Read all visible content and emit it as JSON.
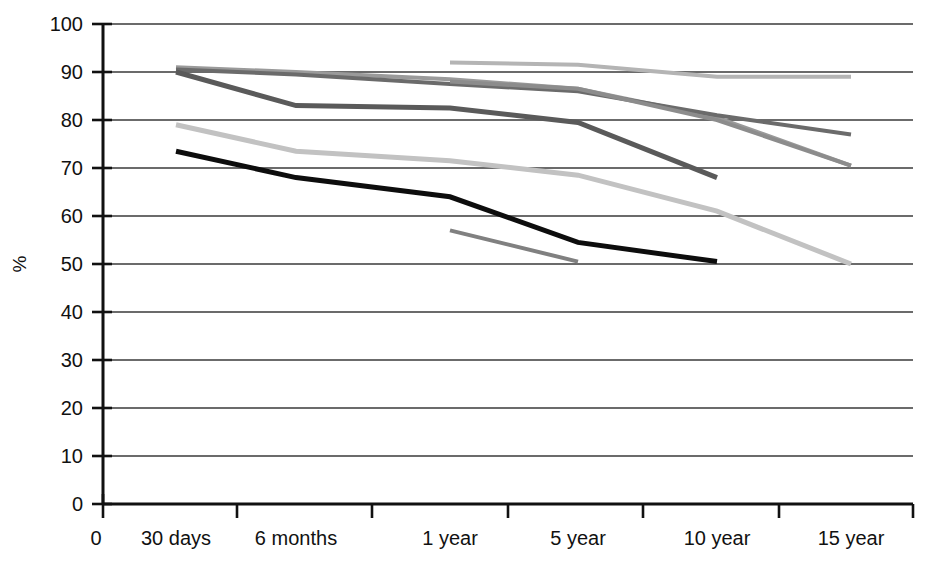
{
  "chart_data": {
    "type": "line",
    "title": "",
    "xlabel": "",
    "ylabel": "%",
    "ylim": [
      0,
      100
    ],
    "ytick_values": [
      0,
      10,
      20,
      30,
      40,
      50,
      60,
      70,
      80,
      90,
      100
    ],
    "ytick_labels": [
      "0",
      "10",
      "20",
      "30",
      "40",
      "50",
      "60",
      "70",
      "80",
      "90",
      "100"
    ],
    "categories": [
      "0",
      "30 days",
      "6 months",
      "1 year",
      "5 year",
      "10 year",
      "15 year"
    ],
    "grid": "horizontal",
    "legend": "none",
    "series": [
      {
        "name": "series-1",
        "color": "#9a9a9a",
        "width": 4,
        "x": [
          "30 days",
          "6 months",
          "1 year",
          "5 year",
          "10 year",
          "15 year"
        ],
        "values": [
          91,
          90,
          88.5,
          86.5,
          80.5,
          70.5
        ]
      },
      {
        "name": "series-2",
        "color": "#6b6b6b",
        "width": 4,
        "x": [
          "30 days",
          "6 months",
          "1 year",
          "5 year",
          "10 year",
          "15 year"
        ],
        "values": [
          90.5,
          89.5,
          87.5,
          86,
          81,
          77
        ]
      },
      {
        "name": "series-3",
        "color": "#5a5a5a",
        "width": 5,
        "x": [
          "30 days",
          "6 months",
          "1 year",
          "5 year",
          "10 year"
        ],
        "values": [
          90,
          83,
          82.5,
          79.5,
          68
        ]
      },
      {
        "name": "series-4",
        "color": "#b4b4b4",
        "width": 4,
        "x": [
          "1 year",
          "5 year",
          "10 year",
          "15 year"
        ],
        "values": [
          92,
          91.5,
          89,
          89
        ]
      },
      {
        "name": "series-5",
        "color": "#8c8c8c",
        "width": 4,
        "x": [
          "1 year",
          "5 year",
          "10 year",
          "15 year"
        ],
        "values": [
          88,
          86.5,
          80,
          70.5
        ]
      },
      {
        "name": "series-6",
        "color": "#c2c2c2",
        "width": 5,
        "x": [
          "30 days",
          "6 months",
          "1 year",
          "5 year",
          "10 year",
          "15 year"
        ],
        "values": [
          79,
          73.5,
          71.5,
          68.5,
          61,
          50
        ]
      },
      {
        "name": "series-7",
        "color": "#0d0d0d",
        "width": 5,
        "x": [
          "30 days",
          "6 months",
          "1 year",
          "5 year",
          "10 year"
        ],
        "values": [
          73.5,
          68,
          64,
          54.5,
          50.5
        ]
      },
      {
        "name": "series-8",
        "color": "#808080",
        "width": 4,
        "x": [
          "1 year",
          "5 year"
        ],
        "values": [
          57,
          50.5
        ]
      }
    ]
  },
  "axis": {
    "y_axis_title": "%",
    "x_origin_label": "0"
  }
}
